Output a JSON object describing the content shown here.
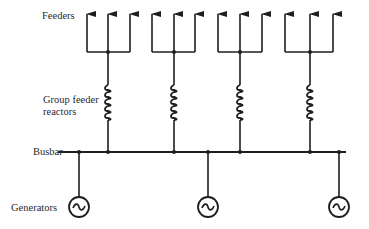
{
  "diagram": {
    "type": "single-line power distribution diagram",
    "labels": {
      "feeders": "Feeders",
      "reactors_line1": "Group feeder",
      "reactors_line2": "reactors",
      "busbar": "Busbar",
      "generators": "Generators"
    },
    "colors": {
      "line": "#1e1e1e",
      "background": "#ffffff"
    },
    "feeder_groups": [
      {
        "branches_x": [
          87,
          108,
          130
        ],
        "trunk_x": 108
      },
      {
        "branches_x": [
          152,
          174,
          195
        ],
        "trunk_x": 174
      },
      {
        "branches_x": [
          218,
          240,
          262
        ],
        "trunk_x": 240
      },
      {
        "branches_x": [
          285,
          310,
          333
        ],
        "trunk_x": 310
      }
    ],
    "generators_x": [
      79,
      208,
      339
    ],
    "busbar": {
      "x_start": 58,
      "x_end": 346,
      "y": 152
    }
  }
}
